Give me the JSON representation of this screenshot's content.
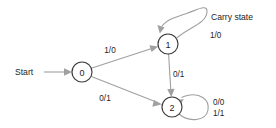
{
  "diagram": {
    "type": "finite-state-machine",
    "title_annotation": "Carry state",
    "start_label": "Start",
    "states": [
      {
        "id": "0",
        "label": "0",
        "cx": 82,
        "cy": 72,
        "r": 10
      },
      {
        "id": "1",
        "label": "1",
        "cx": 168,
        "cy": 44,
        "r": 10
      },
      {
        "id": "2",
        "label": "2",
        "cx": 172,
        "cy": 107,
        "r": 10
      }
    ],
    "transitions": [
      {
        "from": "0",
        "to": "1",
        "label": "1/0",
        "label_x": 110,
        "label_y": 50
      },
      {
        "from": "0",
        "to": "2",
        "label": "0/1",
        "label_x": 105,
        "label_y": 98
      },
      {
        "from": "1",
        "to": "2",
        "label": "0/1",
        "label_x": 173,
        "label_y": 74
      },
      {
        "from": "1",
        "to": "1",
        "label": "1/0",
        "label_x": 210,
        "label_y": 35,
        "self_loop": true
      },
      {
        "from": "2",
        "to": "2",
        "label": "0/0\n1/1",
        "label_x": 213,
        "label_y": 103,
        "self_loop": true
      }
    ],
    "self_loop_2_labels": [
      "0/0",
      "1/1"
    ],
    "colors": {
      "background": "#ffffff",
      "node_stroke": "#3b3b3b",
      "edge_stroke": "#a0a0a0",
      "text": "#1d1d1d"
    }
  }
}
